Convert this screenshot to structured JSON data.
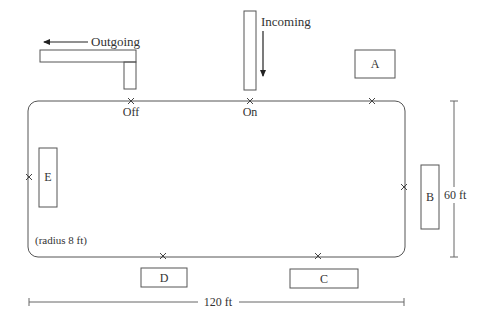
{
  "diagram": {
    "type": "track-layout",
    "track": {
      "corner_note": "(radius 8 ft)",
      "width_label": "120 ft",
      "height_label": "60 ft"
    },
    "flows": {
      "outgoing": {
        "label": "Outgoing"
      },
      "incoming": {
        "label": "Incoming"
      }
    },
    "points": {
      "off": "Off",
      "on": "On"
    },
    "stations": [
      {
        "id": "A",
        "label": "A"
      },
      {
        "id": "B",
        "label": "B"
      },
      {
        "id": "C",
        "label": "C"
      },
      {
        "id": "D",
        "label": "D"
      },
      {
        "id": "E",
        "label": "E"
      }
    ]
  }
}
